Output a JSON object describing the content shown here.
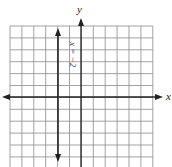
{
  "figure": {
    "type": "coordinate-plane",
    "x_axis_label": "x",
    "y_axis_label": "y",
    "grid": {
      "columns": 12,
      "rows": 12,
      "x_range": [
        -6,
        6
      ],
      "y_range": [
        -6,
        6
      ]
    },
    "line": {
      "equation": "x = −2",
      "orientation": "vertical",
      "x_value": -2
    },
    "colors": {
      "grid": "#8a8a8a",
      "axes": "#222222",
      "line": "#222222",
      "background": "#ffffff"
    }
  }
}
